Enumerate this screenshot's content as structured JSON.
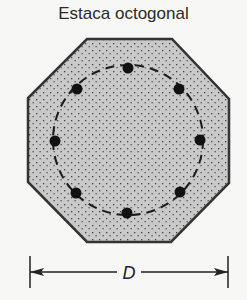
{
  "title": "Estaca octogonal",
  "dimension_label": "D",
  "colors": {
    "concrete": "#c9c9c9",
    "outline": "#333333",
    "bars": "#111111",
    "background": "#f7f7f5"
  },
  "octagon_points": "87,39 172,39 229,99 229,183 171,242 87,242 28,182 28,98",
  "tie_circle": {
    "cx": 128,
    "cy": 140,
    "r": 75
  },
  "bars": [
    {
      "cx": 128,
      "cy": 68
    },
    {
      "cx": 179,
      "cy": 89
    },
    {
      "cx": 200,
      "cy": 140
    },
    {
      "cx": 180,
      "cy": 192
    },
    {
      "cx": 127,
      "cy": 213
    },
    {
      "cx": 76,
      "cy": 193
    },
    {
      "cx": 55,
      "cy": 141
    },
    {
      "cx": 77,
      "cy": 89
    }
  ],
  "dimension": {
    "x1": 30,
    "x2": 228,
    "y": 272
  }
}
